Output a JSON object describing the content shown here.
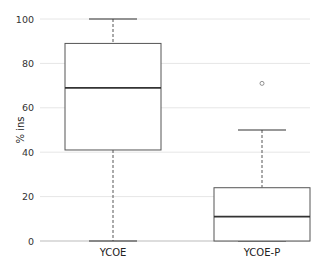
{
  "chart_data": {
    "type": "box",
    "title": "",
    "xlabel": "",
    "ylabel": "% ins",
    "ylim": [
      0,
      100
    ],
    "yticks": [
      0,
      20,
      40,
      60,
      80,
      100
    ],
    "grid": true,
    "legend": null,
    "categories": [
      "YCOE",
      "YCOE-P"
    ],
    "series": [
      {
        "name": "YCOE",
        "whisker_low": 0,
        "q1": 41,
        "median": 69,
        "q3": 89,
        "whisker_high": 100,
        "outliers": []
      },
      {
        "name": "YCOE-P",
        "whisker_low": 0,
        "q1": 0,
        "median": 11,
        "q3": 24,
        "whisker_high": 50,
        "outliers": [
          71
        ]
      }
    ]
  },
  "colors": {
    "box_stroke": "#555555",
    "median": "#333333",
    "grid": "#e6e6e6",
    "text": "#333333"
  }
}
